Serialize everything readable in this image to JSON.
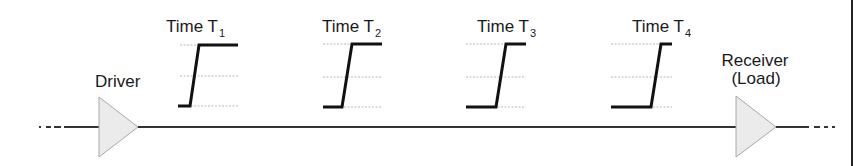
{
  "diagram": {
    "driver_label": "Driver",
    "receiver_label_line1": "Receiver",
    "receiver_label_line2": "(Load)",
    "waveforms": [
      {
        "label": "Time T",
        "subscript": "1"
      },
      {
        "label": "Time T",
        "subscript": "2"
      },
      {
        "label": "Time T",
        "subscript": "3"
      },
      {
        "label": "Time T",
        "subscript": "4"
      }
    ],
    "colors": {
      "waveform": "#111111",
      "trace": "#333333",
      "buffer_fill": "#ebebeb",
      "grid": "#b8b8b8"
    }
  }
}
